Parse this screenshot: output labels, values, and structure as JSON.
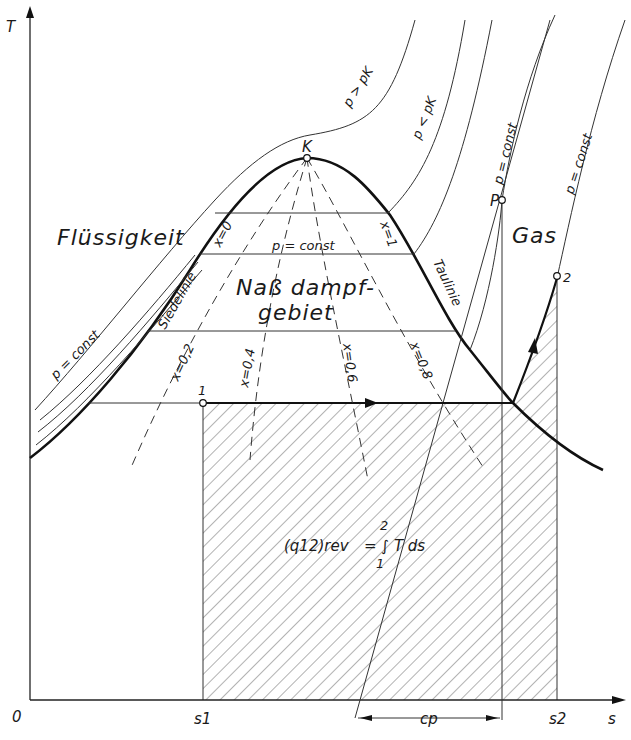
{
  "figure": {
    "type": "T-s diagram (temperature-entropy) of a real substance",
    "axes": {
      "y_label": "T",
      "x_label": "s",
      "origin_label": "0",
      "x_ticks": [
        "s1",
        "s2"
      ]
    },
    "regions": {
      "liquid": "Flüssigkeit",
      "gas": "Gas",
      "wet_steam_line1": "Naß dampf-",
      "wet_steam_line2": "gebiet"
    },
    "curves": {
      "boiling_line": "Siedelinie",
      "dew_line": "Taulinie",
      "critical_point": "K",
      "isobar_above_critical": "p > pK",
      "isobar_below_critical": "p < pK",
      "isobar_const": "p = const",
      "isobar_const_liquid": "p = const",
      "isobar_const_gas_1": "p = const",
      "isobar_const_gas_2": "p = const",
      "quality_lines": [
        "x=0",
        "x=0,2",
        "x=0,4",
        "x=0,6",
        "x=0,8",
        "x=1"
      ]
    },
    "points": {
      "p1": "1",
      "p2": "2",
      "tangent_point": "P"
    },
    "annotations": {
      "heat_integral_lhs": "(q12)rev",
      "heat_integral_rhs": "= ∫ T ds",
      "integral_upper": "2",
      "integral_lower": "1",
      "subtangent": "cp"
    }
  }
}
